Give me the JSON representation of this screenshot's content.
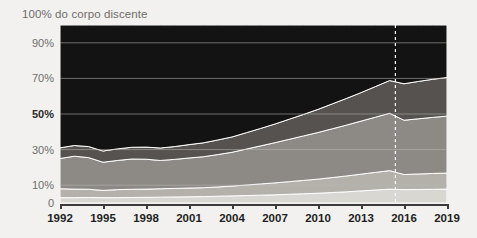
{
  "chart_data": {
    "type": "area",
    "title": "100% do corpo discente",
    "xlabel": "",
    "ylabel": "",
    "ylim": [
      0,
      100
    ],
    "xlim": [
      1992,
      2019
    ],
    "grid": true,
    "legend_position": "none",
    "stacked": true,
    "normalized_percent": true,
    "ytick_labels": [
      "90%",
      "70%",
      "50%",
      "30%",
      "10%",
      "0"
    ],
    "ytick_values": [
      90,
      70,
      50,
      30,
      10,
      0
    ],
    "ytick_emphasis": "50%",
    "xtick_labels": [
      "1992",
      "1995",
      "1998",
      "2001",
      "2004",
      "2007",
      "2010",
      "2013",
      "2016",
      "2019"
    ],
    "xtick_values": [
      1992,
      1995,
      1998,
      2001,
      2004,
      2007,
      2010,
      2013,
      2016,
      2019
    ],
    "x": [
      1992,
      1993,
      1994,
      1995,
      1996,
      1997,
      1998,
      1999,
      2000,
      2001,
      2002,
      2003,
      2004,
      2005,
      2006,
      2007,
      2008,
      2009,
      2010,
      2011,
      2012,
      2013,
      2014,
      2015,
      2016,
      2017,
      2018,
      2019
    ],
    "annotations": [
      {
        "type": "vertical-dashed-line",
        "x": 2015.4,
        "color": "#ffffff"
      }
    ],
    "series": [
      {
        "name": "band-1",
        "color": "#d9d7d2",
        "values": [
          3.0,
          3.0,
          3.1,
          3.0,
          3.0,
          3.1,
          3.2,
          3.3,
          3.4,
          3.5,
          3.6,
          3.8,
          4.0,
          4.2,
          4.4,
          4.6,
          4.9,
          5.2,
          5.5,
          5.9,
          6.3,
          6.8,
          7.3,
          7.8,
          7.5,
          7.6,
          7.7,
          7.8
        ]
      },
      {
        "name": "band-2",
        "color": "#b4b1ab",
        "values": [
          5.0,
          4.8,
          4.6,
          4.1,
          4.5,
          4.6,
          4.6,
          4.7,
          4.8,
          4.9,
          5.0,
          5.2,
          5.5,
          5.9,
          6.3,
          6.7,
          7.1,
          7.5,
          7.9,
          8.4,
          8.9,
          9.4,
          9.9,
          10.4,
          8.5,
          8.7,
          8.9,
          9.0
        ]
      },
      {
        "name": "band-3",
        "color": "#8d8a85",
        "values": [
          17.0,
          18.5,
          17.8,
          15.8,
          16.4,
          17.0,
          16.8,
          15.9,
          16.3,
          16.9,
          17.4,
          18.2,
          19.0,
          20.2,
          21.4,
          22.6,
          23.8,
          25.0,
          26.2,
          27.4,
          28.6,
          29.8,
          31.0,
          32.2,
          30.5,
          31.0,
          31.5,
          32.0
        ]
      },
      {
        "name": "band-4",
        "color": "#55524f",
        "values": [
          6.0,
          6.0,
          6.2,
          6.3,
          6.5,
          6.6,
          6.8,
          7.0,
          7.2,
          7.5,
          7.8,
          8.2,
          8.6,
          9.2,
          9.8,
          10.5,
          11.3,
          12.1,
          13.0,
          14.0,
          15.0,
          16.0,
          17.2,
          18.4,
          20.5,
          21.0,
          21.4,
          21.7
        ]
      },
      {
        "name": "band-5",
        "color": "#131313",
        "values": [
          69.0,
          67.7,
          68.3,
          70.8,
          69.6,
          68.7,
          68.6,
          69.1,
          68.3,
          67.2,
          66.2,
          64.6,
          62.9,
          60.5,
          58.1,
          55.6,
          52.9,
          50.2,
          47.4,
          44.3,
          41.2,
          38.0,
          34.6,
          31.2,
          33.0,
          31.7,
          30.5,
          29.5
        ]
      }
    ]
  },
  "colors": {
    "background": "#f2f1ef",
    "plot_background": "#0d0d0d",
    "gridline": "#b9b7b2",
    "axis": "#3b3b3b",
    "tick_text": "#1f1f1f",
    "ylabel_text": "#6e6d6b",
    "emphasis_text": "#2a2a2a",
    "reference_line": "#ffffff"
  }
}
